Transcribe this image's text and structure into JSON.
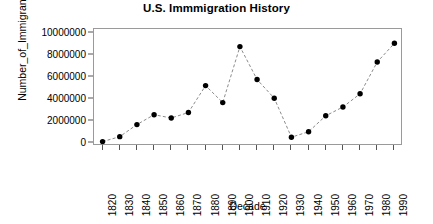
{
  "chart_data": {
    "type": "line",
    "title": "U.S. Immmigration History",
    "xlabel": "Decade",
    "ylabel": "Number_of_Immigrants",
    "categories": [
      1820,
      1830,
      1840,
      1850,
      1860,
      1870,
      1880,
      1890,
      1900,
      1910,
      1920,
      1930,
      1940,
      1950,
      1960,
      1970,
      1980,
      1990
    ],
    "values": [
      150000,
      600000,
      1700000,
      2600000,
      2300000,
      2800000,
      5250000,
      3700000,
      8800000,
      5800000,
      4100000,
      550000,
      1050000,
      2500000,
      3300000,
      4500000,
      7400000,
      9100000
    ],
    "series": [
      {
        "name": "Number_of_Immigrants",
        "values": [
          150000,
          600000,
          1700000,
          2600000,
          2300000,
          2800000,
          5250000,
          3700000,
          8800000,
          5800000,
          4100000,
          550000,
          1050000,
          2500000,
          3300000,
          4500000,
          7400000,
          9100000
        ]
      }
    ],
    "x_tick_labels": [
      "1820",
      "1830",
      "1840",
      "1850",
      "1860",
      "1870",
      "1880",
      "1890",
      "1900",
      "1910",
      "1920",
      "1930",
      "1940",
      "1950",
      "1960",
      "1970",
      "1980",
      "1990"
    ],
    "y_tick_labels": [
      "0",
      "2000000",
      "4000000",
      "6000000",
      "8000000",
      "10000000"
    ],
    "y_tick_values": [
      0,
      2000000,
      4000000,
      6000000,
      8000000,
      10000000
    ],
    "ylim": [
      -250000,
      10400000
    ],
    "xlim": [
      1815,
      1995
    ],
    "grid": false,
    "legend": false,
    "line_style": "dashed",
    "marker": "filled-circle",
    "colors": {
      "line": "#8c8c8c",
      "marker": "#000000",
      "frame": "#9a9a9a",
      "text": "#000000",
      "background": "#ffffff"
    }
  }
}
